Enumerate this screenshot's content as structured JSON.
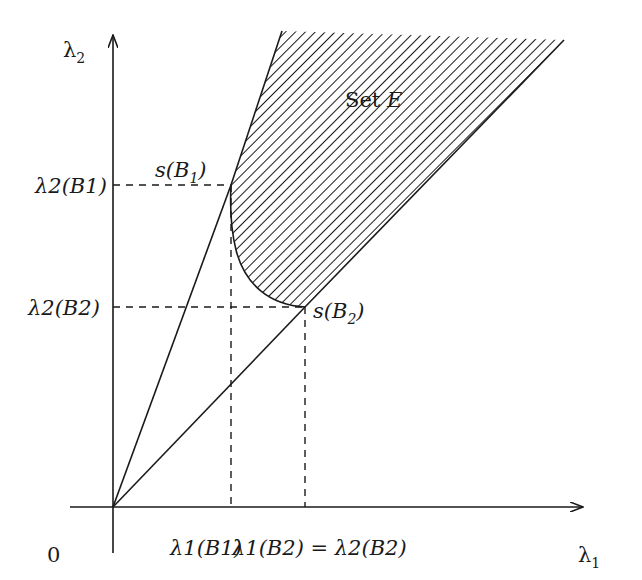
{
  "diagram": {
    "axes": {
      "x_label": "λ",
      "x_label_sub": "1",
      "y_label": "λ",
      "y_label_sub": "2",
      "origin_label": "0"
    },
    "region": {
      "label_prefix": "Set ",
      "label_var": "E",
      "fill": "diagonal-hatch"
    },
    "points": [
      {
        "name": "s(B1)",
        "text_pre": "s(B",
        "text_sub": "1",
        "text_post": ")"
      },
      {
        "name": "s(B2)",
        "text_pre": "s(B",
        "text_sub": "2",
        "text_post": ")"
      }
    ],
    "y_ticks": [
      {
        "label": "λ2(B1)"
      },
      {
        "label": "λ2(B2)"
      }
    ],
    "x_ticks": [
      {
        "label": "λ1(B1)"
      },
      {
        "label": "λ1(B2) = λ2(B2)"
      }
    ],
    "colors": {
      "line": "#1a1a1a",
      "background": "#ffffff"
    }
  }
}
